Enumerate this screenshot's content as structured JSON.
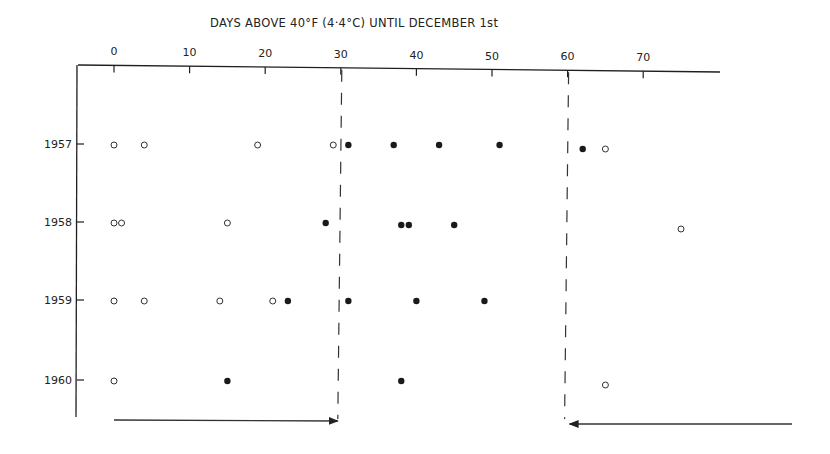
{
  "chart_data": {
    "type": "scatter",
    "title": "DAYS ABOVE 40°F (4·4°C) UNTIL DECEMBER 1st",
    "xlabel": "DAYS ABOVE 40°F (4·4°C) UNTIL DECEMBER 1st",
    "ylabel": "",
    "x_axis_position": "top",
    "xlim": [
      -6,
      82
    ],
    "x_ticks": [
      0,
      10,
      20,
      30,
      40,
      50,
      60,
      70
    ],
    "categories": [
      "1957",
      "1958",
      "1959",
      "1960"
    ],
    "grid": false,
    "legend": null,
    "series": [
      {
        "name": "open circles",
        "marker": "open-circle",
        "points": [
          {
            "year": "1957",
            "x": 0
          },
          {
            "year": "1957",
            "x": 4
          },
          {
            "year": "1957",
            "x": 19
          },
          {
            "year": "1957",
            "x": 29
          },
          {
            "year": "1957",
            "x": 65
          },
          {
            "year": "1958",
            "x": 0
          },
          {
            "year": "1958",
            "x": 1
          },
          {
            "year": "1958",
            "x": 15
          },
          {
            "year": "1958",
            "x": 75
          },
          {
            "year": "1959",
            "x": 0
          },
          {
            "year": "1959",
            "x": 4
          },
          {
            "year": "1959",
            "x": 14
          },
          {
            "year": "1959",
            "x": 21
          },
          {
            "year": "1960",
            "x": 0
          },
          {
            "year": "1960",
            "x": 65
          }
        ]
      },
      {
        "name": "filled circles",
        "marker": "filled-circle",
        "points": [
          {
            "year": "1957",
            "x": 31
          },
          {
            "year": "1957",
            "x": 37
          },
          {
            "year": "1957",
            "x": 43
          },
          {
            "year": "1957",
            "x": 51
          },
          {
            "year": "1957",
            "x": 62
          },
          {
            "year": "1958",
            "x": 28
          },
          {
            "year": "1958",
            "x": 38
          },
          {
            "year": "1958",
            "x": 39
          },
          {
            "year": "1958",
            "x": 45
          },
          {
            "year": "1959",
            "x": 23
          },
          {
            "year": "1959",
            "x": 31
          },
          {
            "year": "1959",
            "x": 40
          },
          {
            "year": "1959",
            "x": 49
          },
          {
            "year": "1960",
            "x": 15
          },
          {
            "year": "1960",
            "x": 38
          }
        ]
      }
    ],
    "annotations": [
      {
        "type": "dashed-vline",
        "x": 30
      },
      {
        "type": "dashed-vline",
        "x": 60
      },
      {
        "type": "arrow",
        "direction": "right",
        "from_x": 0,
        "to_x": 30
      },
      {
        "type": "arrow",
        "direction": "left",
        "from_x": 82,
        "to_x": 60
      }
    ]
  },
  "layout": {
    "x0_px": 114,
    "px_per_day": 7.56,
    "row_y": {
      "1957": 145,
      "1958": 223,
      "1959": 301,
      "1960": 381
    },
    "axis_y_left": 65,
    "axis_y_right": 72,
    "axis_x_start": 78,
    "axis_x_end": 720,
    "left_axis_bottom": 417,
    "ink_color": "#1f1f1f",
    "dash_color": "#333333"
  }
}
